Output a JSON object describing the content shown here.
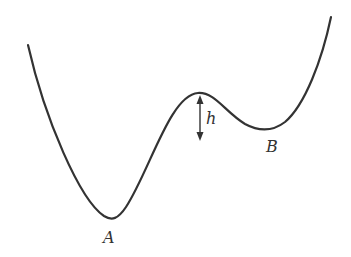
{
  "diagram": {
    "type": "potential-energy-curve",
    "stroke_color": "#333333",
    "labels": {
      "minimum_a": "A",
      "minimum_b": "B",
      "barrier_height": "h"
    },
    "curve_points": {
      "left_end": [
        28,
        45
      ],
      "minimum_a": [
        111,
        220
      ],
      "barrier_peak": [
        200,
        93
      ],
      "minimum_b": [
        265,
        130
      ],
      "right_end": [
        331,
        17
      ]
    }
  }
}
